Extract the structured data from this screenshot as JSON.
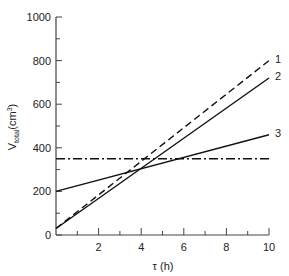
{
  "chart_data": {
    "type": "line",
    "title": "",
    "xlabel": "τ (h)",
    "ylabel": "V_total (cm³)",
    "ylabel_main": "V",
    "ylabel_sub": "total",
    "ylabel_unit": "(cm",
    "ylabel_unit_sup": "3",
    "ylabel_unit_close": ")",
    "xlim": [
      0,
      10
    ],
    "ylim": [
      0,
      1000
    ],
    "x_ticks": [
      2,
      4,
      6,
      8,
      10
    ],
    "x_tick_labels": [
      "2",
      "4",
      "6",
      "8",
      "10"
    ],
    "x_minor_ticks": [
      1,
      3,
      5,
      7,
      9
    ],
    "y_ticks": [
      0,
      200,
      400,
      600,
      800,
      1000
    ],
    "y_tick_labels": [
      "0",
      "200",
      "400",
      "600",
      "800",
      "1000"
    ],
    "y_minor_ticks": [
      100,
      300,
      500,
      700,
      900
    ],
    "grid": false,
    "legend": "inline labels at line ends",
    "series": [
      {
        "name": "1",
        "style": "dashed",
        "x": [
          0,
          10
        ],
        "values": [
          30,
          800
        ]
      },
      {
        "name": "2",
        "style": "solid",
        "x": [
          0,
          10
        ],
        "values": [
          30,
          720
        ]
      },
      {
        "name": "3",
        "style": "solid",
        "x": [
          0,
          10
        ],
        "values": [
          200,
          460
        ]
      },
      {
        "name": "threshold",
        "style": "dash-dot",
        "x": [
          0,
          10
        ],
        "values": [
          350,
          350
        ]
      }
    ]
  }
}
